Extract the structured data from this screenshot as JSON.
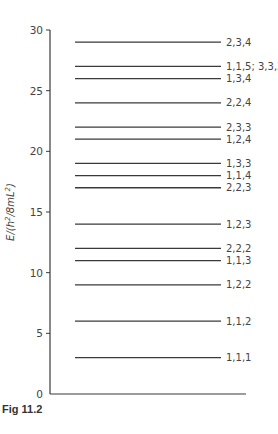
{
  "chart_data": {
    "type": "energy-level-diagram",
    "title": "",
    "caption": "Fig 11.2",
    "ylabel": "E/(h²/8mL²)",
    "ylabel_parts": {
      "pre": "E/(h",
      "sup1": "2",
      "mid": "/8mL",
      "sup2": "2",
      "post": ")"
    },
    "xlabel": "",
    "ylim": [
      0,
      30
    ],
    "yticks": [
      0,
      5,
      10,
      15,
      20,
      25,
      30
    ],
    "grid": false,
    "levels": [
      {
        "energy": 3,
        "label": "1,1,1"
      },
      {
        "energy": 6,
        "label": "1,1,2"
      },
      {
        "energy": 9,
        "label": "1,2,2"
      },
      {
        "energy": 11,
        "label": "1,1,3"
      },
      {
        "energy": 12,
        "label": "2,2,2"
      },
      {
        "energy": 14,
        "label": "1,2,3"
      },
      {
        "energy": 17,
        "label": "2,2,3"
      },
      {
        "energy": 18,
        "label": "1,1,4"
      },
      {
        "energy": 19,
        "label": "1,3,3"
      },
      {
        "energy": 21,
        "label": "1,2,4"
      },
      {
        "energy": 22,
        "label": "2,3,3"
      },
      {
        "energy": 24,
        "label": "2,2,4"
      },
      {
        "energy": 26,
        "label": "1,3,4"
      },
      {
        "energy": 27,
        "label": "1,1,5; 3,3,3"
      },
      {
        "energy": 29,
        "label": "2,3,4"
      }
    ]
  },
  "colors": {
    "line": "#3a3a3a",
    "text": "#444444",
    "background": "#ffffff"
  }
}
